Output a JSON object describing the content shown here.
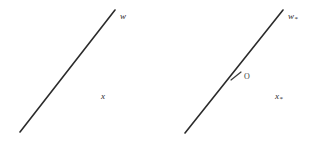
{
  "figure": {
    "background_color": "#ffffff",
    "stroke_color": "#2b2b2b",
    "width": 316,
    "height": 144
  },
  "panels": [
    {
      "id": "left",
      "line": {
        "name": "line-segment-left",
        "x1": 20,
        "y1": 132,
        "x2": 115,
        "y2": 10,
        "stroke_width": 1.6
      },
      "labels": [
        {
          "id": "w",
          "text": "w",
          "star": "",
          "x": 120,
          "y": 12
        },
        {
          "id": "x",
          "text": "x",
          "star": "",
          "x": 101,
          "y": 92
        }
      ],
      "marker": null
    },
    {
      "id": "right",
      "line": {
        "name": "line-segment-right",
        "x1": 27,
        "y1": 133,
        "x2": 125,
        "y2": 10,
        "stroke_width": 1.6
      },
      "labels": [
        {
          "id": "w-star",
          "text": "w",
          "star": "*",
          "x": 130,
          "y": 12
        },
        {
          "id": "x-star",
          "text": "x",
          "star": "*",
          "x": 117,
          "y": 92
        }
      ],
      "marker": {
        "name": "origin-tick",
        "label": "O",
        "cx": 78,
        "cy": 76,
        "tick_dx": 5,
        "tick_dy": 4,
        "label_x": 86,
        "label_y": 73
      }
    }
  ],
  "labels": {
    "left_top": "w",
    "left_bottom": "x",
    "right_top": "w",
    "right_top_star": "*",
    "right_bottom": "x",
    "right_bottom_star": "*",
    "origin": "O"
  }
}
